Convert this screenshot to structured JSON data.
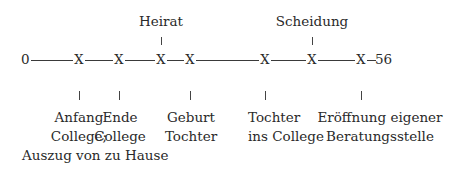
{
  "timeline": {
    "start_label": "0",
    "end_label": "56",
    "line_color": "#3a3a3a",
    "marker_glyph": "X",
    "markers": [
      {
        "x": 79,
        "label_below": [
          "Anfang",
          "College;",
          "Auszug von zu Hause"
        ]
      },
      {
        "x": 119,
        "label_below": [
          "Ende",
          "College"
        ]
      },
      {
        "x": 161,
        "label_above": "Heirat"
      },
      {
        "x": 190,
        "label_below": [
          "Geburt",
          "Tochter"
        ]
      },
      {
        "x": 265,
        "label_below": [
          "Tochter",
          "ins College"
        ]
      },
      {
        "x": 312,
        "label_above": "Scheidung"
      },
      {
        "x": 361,
        "label_below": [
          "Eröffnung eigener",
          "Beratungsstelle"
        ]
      }
    ]
  },
  "labels": {
    "heirat": "Heirat",
    "scheidung": "Scheidung",
    "anfang_1": "Anfang",
    "anfang_2": "College;",
    "anfang_3": "Auszug von zu Hause",
    "ende_1": "Ende",
    "ende_2": "College",
    "geburt_1": "Geburt",
    "geburt_2": "Tochter",
    "tochter_1": "Tochter",
    "tochter_2": "ins College",
    "eroeffnung_1": "Eröffnung eigener",
    "eroeffnung_2": "Beratungsstelle"
  }
}
